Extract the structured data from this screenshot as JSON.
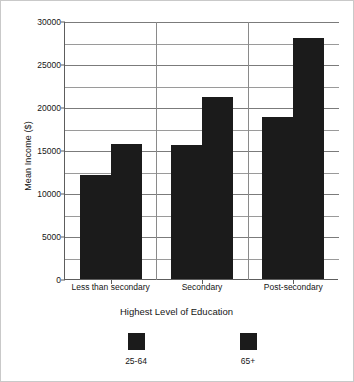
{
  "chart_data": {
    "type": "bar",
    "title": "",
    "xlabel": "Highest Level of Education",
    "ylabel": "Mean Income ($)",
    "categories": [
      "Less than secondary",
      "Secondary",
      "Post-secondary"
    ],
    "series": [
      {
        "name": "25-64",
        "color": "#1b1b1b",
        "values": [
          12100,
          15600,
          18800
        ]
      },
      {
        "name": "65+",
        "color": "#1b1b1b",
        "values": [
          15700,
          21200,
          28000
        ]
      }
    ],
    "ylim": [
      0,
      30000
    ],
    "ytick_labels": [
      "0",
      "5000",
      "10000",
      "15000",
      "20000",
      "25000",
      "30000"
    ],
    "ytick_values": [
      0,
      5000,
      10000,
      15000,
      20000,
      25000,
      30000
    ],
    "minor_gridline_values": [
      2500,
      7500,
      12500,
      17500,
      22500,
      27500
    ],
    "grid": true,
    "legend_position": "bottom",
    "legend_entries": [
      "25-64",
      "65+"
    ]
  },
  "axes": {
    "y_title": "Mean Income ($)",
    "x_title": "Highest Level of Education"
  }
}
